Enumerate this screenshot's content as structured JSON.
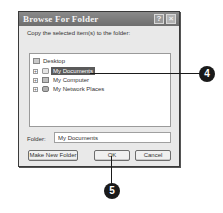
{
  "dialog": {
    "title": "Browse For Folder",
    "help_glyph": "?",
    "close_glyph": "×",
    "prompt": "Copy the selected item(s) to the folder:"
  },
  "tree": {
    "root": {
      "label": "Desktop",
      "icon": "desktop-icon"
    },
    "items": [
      {
        "label": "My Documents",
        "icon": "folder-icon",
        "expander": "+",
        "selected": true
      },
      {
        "label": "My Computer",
        "icon": "computer-icon",
        "expander": "+",
        "selected": false
      },
      {
        "label": "My Network Places",
        "icon": "network-icon",
        "expander": "+",
        "selected": false
      }
    ]
  },
  "folder": {
    "label": "Folder:",
    "value": "My Documents"
  },
  "buttons": {
    "make_new_folder": "Make New Folder",
    "ok": "OK",
    "cancel": "Cancel"
  },
  "callouts": [
    {
      "number": "4",
      "target": "My Documents"
    },
    {
      "number": "5",
      "target": "OK"
    }
  ],
  "colors": {
    "titlebar": "#7a7a7a",
    "dialog_bg": "#e9e9e9",
    "selection": "#5a5a5a",
    "callout": "#1a1a1a"
  }
}
